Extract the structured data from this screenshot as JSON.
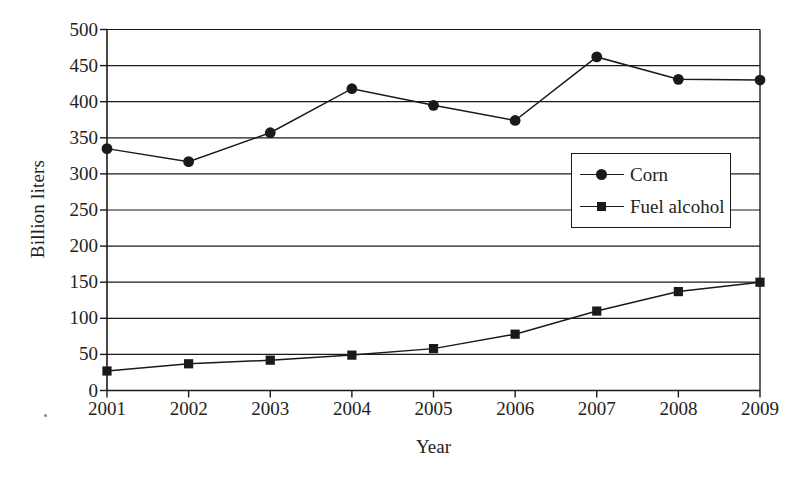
{
  "chart_data": {
    "type": "line",
    "title": "",
    "xlabel": "Year",
    "ylabel": "Billion liters",
    "categories": [
      "2001",
      "2002",
      "2003",
      "2004",
      "2005",
      "2006",
      "2007",
      "2008",
      "2009"
    ],
    "x": [
      2001,
      2002,
      2003,
      2004,
      2005,
      2006,
      2007,
      2008,
      2009
    ],
    "series": [
      {
        "name": "Corn",
        "marker": "circle",
        "values": [
          335,
          317,
          357,
          418,
          395,
          374,
          462,
          431,
          430
        ]
      },
      {
        "name": "Fuel alcohol",
        "marker": "square",
        "values": [
          27,
          37,
          42,
          49,
          58,
          78,
          110,
          137,
          150
        ]
      }
    ],
    "ylim": [
      0,
      500
    ],
    "ytick_labels": [
      "0",
      "50",
      "100",
      "150",
      "200",
      "250",
      "300",
      "350",
      "400",
      "450",
      "500"
    ],
    "ytick_values": [
      0,
      50,
      100,
      150,
      200,
      250,
      300,
      350,
      400,
      450,
      500
    ],
    "xlim": [
      2001,
      2009
    ],
    "grid": "horizontal",
    "legend_position": "center-right",
    "line_color": "#1a1a1a",
    "background_color": "#ffffff"
  },
  "legend": {
    "entries": [
      {
        "label": "Corn",
        "marker": "circle"
      },
      {
        "label": "Fuel alcohol",
        "marker": "square"
      }
    ]
  }
}
